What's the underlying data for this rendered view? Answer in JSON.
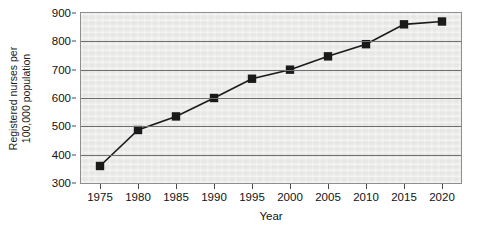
{
  "chart_data": {
    "type": "line",
    "title": "",
    "subtitle": "",
    "xlabel": "Year",
    "ylabel": "Registered nurses per 100,000 population",
    "ylabel_line1": "Registered nurses per",
    "ylabel_line2": "100,000 population",
    "x": [
      1975,
      1980,
      1985,
      1990,
      1995,
      2000,
      2005,
      2010,
      2015,
      2020
    ],
    "xtick_labels": [
      "1975",
      "1980",
      "1985",
      "1990",
      "1995",
      "2000",
      "2005",
      "2010",
      "2015",
      "2020"
    ],
    "values": [
      360,
      487,
      535,
      600,
      668,
      700,
      747,
      790,
      860,
      870
    ],
    "ytick_labels": [
      "900",
      "800",
      "700",
      "600",
      "500",
      "400",
      "300"
    ],
    "ytick_values": [
      900,
      800,
      700,
      600,
      500,
      400,
      300
    ],
    "ylim": [
      300,
      900
    ],
    "xlim": [
      1972.5,
      2022.5
    ],
    "grid": true,
    "grid_axis": "y",
    "legend": false,
    "legend_position": "none",
    "marker": "square",
    "series": [
      {
        "name": "Registered nurses per 100,000 population",
        "values": [
          360,
          487,
          535,
          600,
          668,
          700,
          747,
          790,
          860,
          870
        ]
      }
    ],
    "colors": {
      "line": "#1a1a1a",
      "marker": "#1a1a1a",
      "plot_background": "#ececeb",
      "gridline": "#6f6f6f",
      "frame": "#8e8e8e",
      "text": "#111111"
    }
  }
}
